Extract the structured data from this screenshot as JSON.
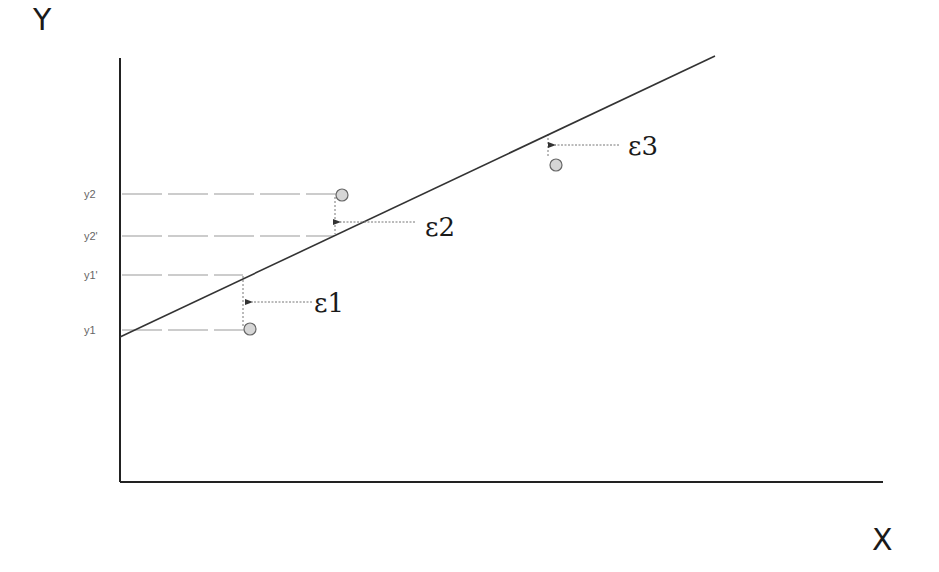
{
  "diagram": {
    "axes": {
      "x_label": "X",
      "y_label": "Y"
    },
    "y_ticks": [
      {
        "label": "y2",
        "y": 194
      },
      {
        "label": "y2'",
        "y": 236
      },
      {
        "label": "y1'",
        "y": 275
      },
      {
        "label": "y1",
        "y": 330
      }
    ],
    "residuals": [
      {
        "label": "ε1",
        "point": [
          250,
          329
        ],
        "fitted": [
          243,
          276
        ]
      },
      {
        "label": "ε2",
        "point": [
          342,
          195
        ],
        "fitted": [
          335,
          233
        ]
      },
      {
        "label": "ε3",
        "point": [
          556,
          165
        ],
        "fitted": [
          548,
          134
        ]
      }
    ],
    "regression_line": {
      "from": [
        120,
        337
      ],
      "to": [
        715,
        56
      ]
    },
    "colors": {
      "line": "#333333",
      "axis": "#222222",
      "dotted": "#888888",
      "point_fill": "#d4d4d4",
      "point_stroke": "#666666"
    }
  }
}
